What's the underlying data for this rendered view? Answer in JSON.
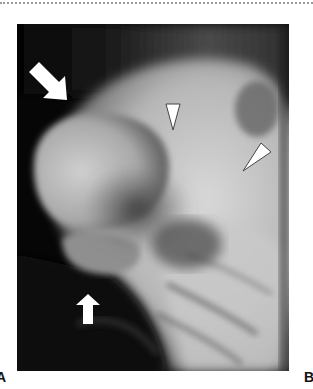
{
  "figure": {
    "panel_labels": {
      "left": "A",
      "right": "B"
    },
    "image": {
      "type": "radiograph",
      "annotations": {
        "arrows": [
          {
            "name": "upper-arrow",
            "direction": "down-right",
            "color": "#ffffff"
          },
          {
            "name": "lower-arrow",
            "direction": "up",
            "color": "#ffffff"
          }
        ],
        "arrowheads": [
          {
            "name": "arrowhead-center",
            "direction": "down",
            "color": "#ffffff"
          },
          {
            "name": "arrowhead-right",
            "direction": "down-left",
            "color": "#ffffff"
          }
        ]
      }
    }
  }
}
